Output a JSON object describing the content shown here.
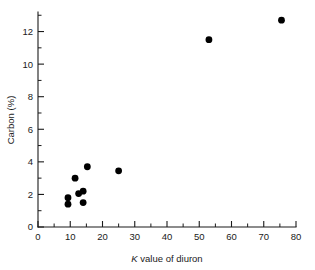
{
  "chart_data": {
    "type": "scatter",
    "title": "",
    "xlabel": "K value of diuron",
    "xlabel_italic_prefix": "K",
    "xlabel_rest": " value of diuron",
    "ylabel": "Carbon (%)",
    "xlim": [
      0,
      80
    ],
    "ylim": [
      0,
      13.2
    ],
    "grid": false,
    "legend": null,
    "x_major_ticks": [
      0,
      10,
      20,
      30,
      40,
      50,
      60,
      70,
      80
    ],
    "x_major_tick_labels": [
      "0",
      "10",
      "20",
      "30",
      "40",
      "50",
      "60",
      "70",
      "80"
    ],
    "x_minor_ticks": [
      5,
      15,
      25,
      35,
      45,
      55,
      65,
      75
    ],
    "y_major_ticks": [
      0,
      2,
      4,
      6,
      8,
      10,
      12
    ],
    "y_major_tick_labels": [
      "0",
      "2",
      "4",
      "6",
      "8",
      "10",
      "12"
    ],
    "y_minor_ticks": [
      1,
      3,
      5,
      7,
      9,
      11,
      13
    ],
    "marker": "filled-circle",
    "marker_color": "#000000",
    "marker_size_px": 3.4,
    "points": [
      {
        "x": 9.3,
        "y": 1.8
      },
      {
        "x": 9.3,
        "y": 1.4
      },
      {
        "x": 11.5,
        "y": 3.0
      },
      {
        "x": 12.6,
        "y": 2.05
      },
      {
        "x": 14.0,
        "y": 2.2
      },
      {
        "x": 14.0,
        "y": 1.5
      },
      {
        "x": 15.3,
        "y": 3.7
      },
      {
        "x": 25.0,
        "y": 3.45
      },
      {
        "x": 53.0,
        "y": 11.5
      },
      {
        "x": 75.5,
        "y": 12.7
      }
    ],
    "series": [
      {
        "name": "samples",
        "x": [
          9.3,
          9.3,
          11.5,
          12.6,
          14.0,
          14.0,
          15.3,
          25.0,
          53.0,
          75.5
        ],
        "values": [
          1.8,
          1.4,
          3.0,
          2.05,
          2.2,
          1.5,
          3.7,
          3.45,
          11.5,
          12.7
        ]
      }
    ]
  },
  "colors": {
    "axis": "#1a1a1a",
    "marker": "#000000",
    "background": "#ffffff"
  }
}
